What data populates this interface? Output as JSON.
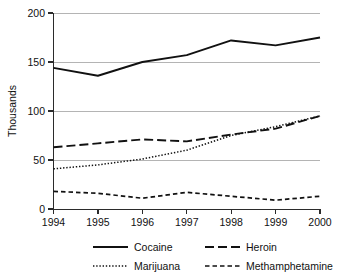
{
  "chart_data": {
    "type": "line",
    "title": "",
    "xlabel": "",
    "ylabel": "Thousands",
    "x": [
      1994,
      1995,
      1996,
      1997,
      1998,
      1999,
      2000
    ],
    "categories": [
      "1994",
      "1995",
      "1996",
      "1997",
      "1998",
      "1999",
      "2000"
    ],
    "xlim": [
      1994,
      2000
    ],
    "ylim": [
      0,
      200
    ],
    "yticks": [
      0,
      50,
      100,
      150,
      200
    ],
    "ytick_labels": [
      "0",
      "50",
      "100",
      "150",
      "200"
    ],
    "grid": "horizontal",
    "legend_position": "bottom",
    "series": [
      {
        "name": "Cocaine",
        "linestyle": "solid",
        "color": "#111111",
        "values": [
          144,
          136,
          150,
          157,
          172,
          167,
          175
        ]
      },
      {
        "name": "Heroin",
        "linestyle": "long-dash",
        "color": "#111111",
        "values": [
          63,
          67,
          71,
          69,
          76,
          82,
          95
        ]
      },
      {
        "name": "Marijuana",
        "linestyle": "dotted",
        "color": "#111111",
        "values": [
          41,
          45,
          51,
          60,
          75,
          84,
          95
        ]
      },
      {
        "name": "Methamphetamine",
        "linestyle": "short-dash",
        "color": "#111111",
        "values": [
          18,
          16,
          11,
          17,
          13,
          9,
          13
        ]
      }
    ]
  },
  "axis": {
    "y_label": "Thousands",
    "y_ticks": [
      "200",
      "150",
      "100",
      "50",
      "0"
    ],
    "x_ticks": [
      "1994",
      "1995",
      "1996",
      "1997",
      "1998",
      "1999",
      "2000"
    ]
  },
  "legend": {
    "entries": [
      {
        "label": "Cocaine",
        "style": "solid"
      },
      {
        "label": "Heroin",
        "style": "long-dash"
      },
      {
        "label": "Marijuana",
        "style": "dotted"
      },
      {
        "label": "Methamphetamine",
        "style": "short-dash"
      }
    ]
  }
}
